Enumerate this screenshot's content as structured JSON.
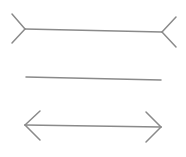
{
  "diagram": {
    "title": "",
    "stroke_color": "#8a8a8a",
    "stroke_width": 1.5,
    "figures": [
      {
        "name": "fins-out-line",
        "shaft": [
          25,
          29,
          162,
          32
        ],
        "left_fins": [
          [
            25,
            29,
            12,
            14
          ],
          [
            25,
            29,
            12,
            43
          ]
        ],
        "right_fins": [
          [
            162,
            32,
            176,
            17
          ],
          [
            162,
            32,
            176,
            47
          ]
        ]
      },
      {
        "name": "plain-line",
        "shaft": [
          26,
          77,
          161,
          80
        ],
        "left_fins": [],
        "right_fins": []
      },
      {
        "name": "arrows-in-line",
        "shaft": [
          25,
          125,
          161,
          127
        ],
        "left_fins": [
          [
            25,
            125,
            40,
            111
          ],
          [
            25,
            125,
            40,
            140
          ]
        ],
        "right_fins": [
          [
            161,
            127,
            146,
            112
          ],
          [
            161,
            127,
            146,
            142
          ]
        ]
      }
    ]
  }
}
